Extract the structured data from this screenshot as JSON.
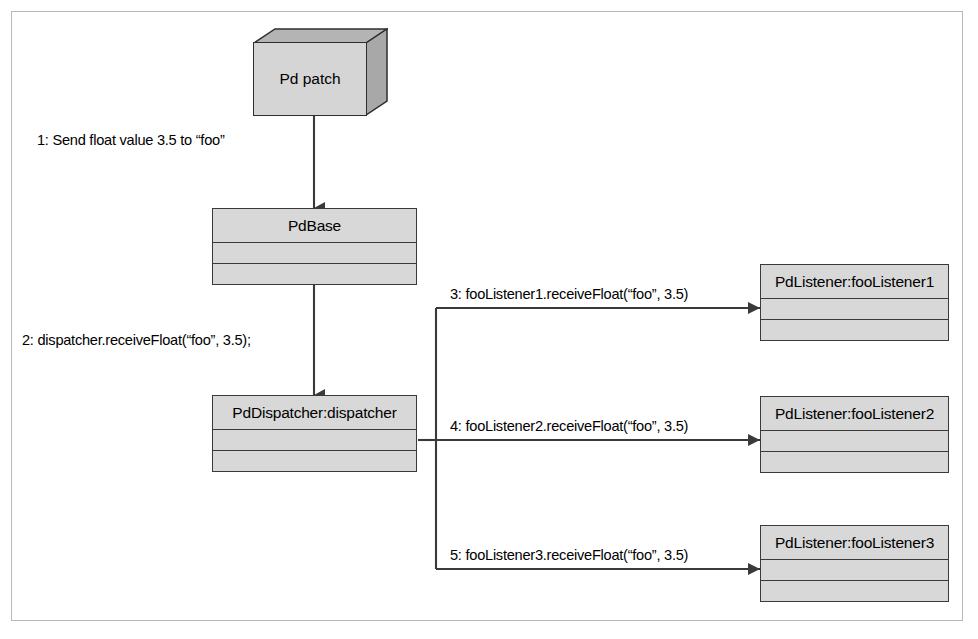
{
  "diagram": {
    "type": "uml-communication-diagram",
    "colors": {
      "box_fill": "#d8d8d8",
      "box_stroke": "#3a3a3a",
      "wire": "#3a3a3a",
      "frame": "#b9b9b9",
      "background": "#ffffff"
    }
  },
  "nodes": {
    "pd_patch": {
      "label": "Pd patch",
      "shape": "3d-node"
    },
    "pdbase": {
      "label": "PdBase",
      "shape": "class-box",
      "compartments": 2
    },
    "dispatcher": {
      "label": "PdDispatcher:dispatcher",
      "shape": "object-box",
      "compartments": 2
    },
    "listener1": {
      "label": "PdListener:fooListener1",
      "shape": "object-box",
      "compartments": 2
    },
    "listener2": {
      "label": "PdListener:fooListener2",
      "shape": "object-box",
      "compartments": 2
    },
    "listener3": {
      "label": "PdListener:fooListener3",
      "shape": "object-box",
      "compartments": 2
    }
  },
  "messages": [
    {
      "seq": "1",
      "text": "1: Send float value 3.5 to “foo”",
      "from": "pd_patch",
      "to": "pdbase"
    },
    {
      "seq": "2",
      "text": "2: dispatcher.receiveFloat(“foo”, 3.5);",
      "from": "pdbase",
      "to": "dispatcher"
    },
    {
      "seq": "3",
      "text": "3: fooListener1.receiveFloat(“foo”, 3.5)",
      "from": "dispatcher",
      "to": "listener1"
    },
    {
      "seq": "4",
      "text": "4: fooListener2.receiveFloat(“foo”, 3.5)",
      "from": "dispatcher",
      "to": "listener2"
    },
    {
      "seq": "5",
      "text": "5: fooListener3.receiveFloat(“foo”, 3.5)",
      "from": "dispatcher",
      "to": "listener3"
    }
  ]
}
